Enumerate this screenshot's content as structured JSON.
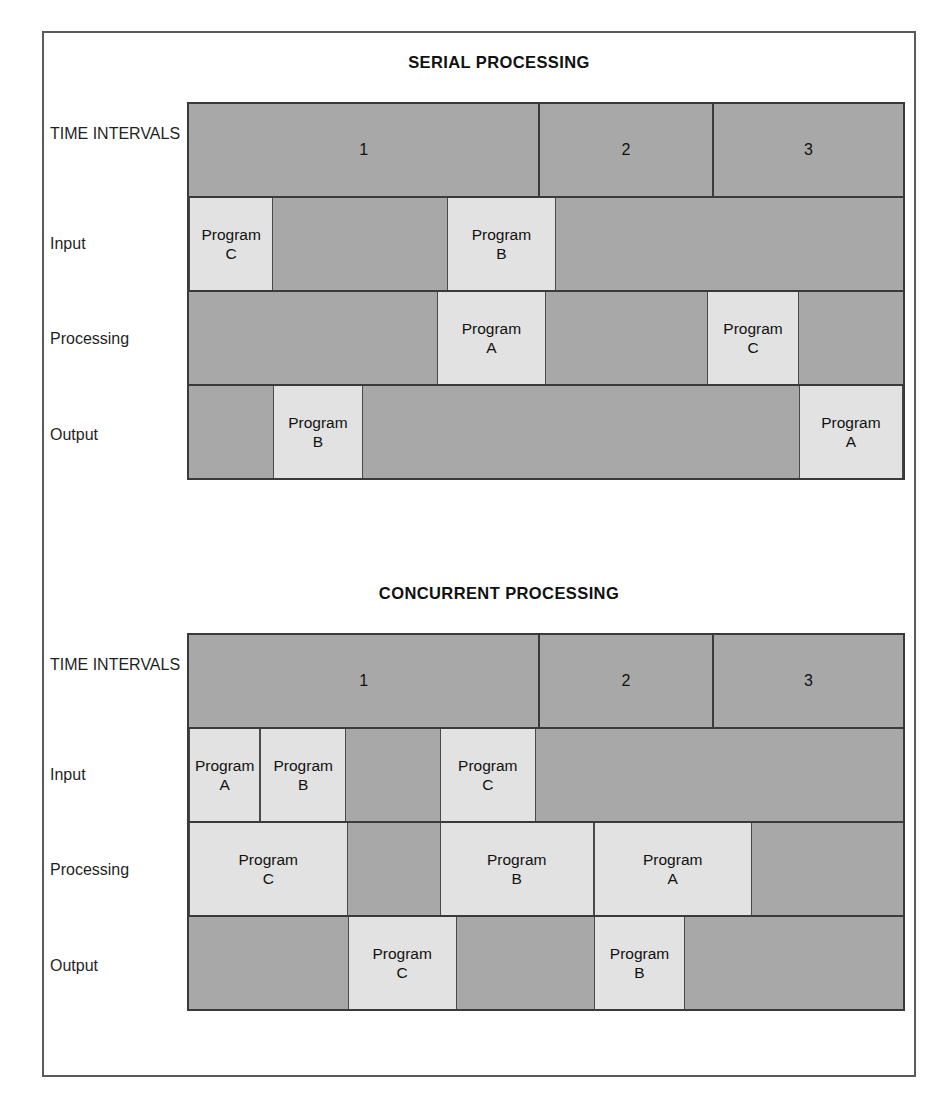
{
  "figure": {
    "background": "#ffffff",
    "border_color": "#5a5a5a",
    "cell_dark_color": "#a8a8a8",
    "cell_light_color": "#e2e2e2",
    "grid_line_color": "#3a3a3a"
  },
  "row_labels": {
    "time_intervals_line1": "TIME",
    "time_intervals_line2": "INTERVALS",
    "input": "Input",
    "processing": "Processing",
    "output": "Output"
  },
  "charts": [
    {
      "id": "serial",
      "title": "SERIAL PROCESSING",
      "intervals": [
        {
          "label": "1",
          "start": 0,
          "end": 49.2
        },
        {
          "label": "2",
          "start": 49.2,
          "end": 73.5
        },
        {
          "label": "3",
          "start": 73.5,
          "end": 100
        }
      ],
      "rows": [
        {
          "name": "Input",
          "blocks": [
            {
              "program_line1": "Program",
              "program_line2": "C",
              "start": 0,
              "end": 11.8
            },
            {
              "program_line1": "Program",
              "program_line2": "B",
              "start": 36.1,
              "end": 51.4
            }
          ]
        },
        {
          "name": "Processing",
          "blocks": [
            {
              "program_line1": "Program",
              "program_line2": "A",
              "start": 34.7,
              "end": 50.0
            },
            {
              "program_line1": "Program",
              "program_line2": "C",
              "start": 72.6,
              "end": 85.4
            }
          ]
        },
        {
          "name": "Output",
          "blocks": [
            {
              "program_line1": "Program",
              "program_line2": "B",
              "start": 11.8,
              "end": 24.3
            },
            {
              "program_line1": "Program",
              "program_line2": "A",
              "start": 85.4,
              "end": 100
            }
          ]
        }
      ]
    },
    {
      "id": "concurrent",
      "title": "CONCURRENT PROCESSING",
      "intervals": [
        {
          "label": "1",
          "start": 0,
          "end": 49.2
        },
        {
          "label": "2",
          "start": 49.2,
          "end": 73.5
        },
        {
          "label": "3",
          "start": 73.5,
          "end": 100
        }
      ],
      "rows": [
        {
          "name": "Input",
          "blocks": [
            {
              "program_line1": "Program",
              "program_line2": "A",
              "start": 0,
              "end": 10.0
            },
            {
              "program_line1": "Program",
              "program_line2": "B",
              "start": 10.0,
              "end": 22.0
            },
            {
              "program_line1": "Program",
              "program_line2": "C",
              "start": 35.1,
              "end": 48.6
            }
          ]
        },
        {
          "name": "Processing",
          "blocks": [
            {
              "program_line1": "Program",
              "program_line2": "C",
              "start": 0,
              "end": 22.2
            },
            {
              "program_line1": "Program",
              "program_line2": "B",
              "start": 35.1,
              "end": 56.7
            },
            {
              "program_line1": "Program",
              "program_line2": "A",
              "start": 56.7,
              "end": 78.8
            }
          ]
        },
        {
          "name": "Output",
          "blocks": [
            {
              "program_line1": "Program",
              "program_line2": "C",
              "start": 22.2,
              "end": 37.5
            },
            {
              "program_line1": "Program",
              "program_line2": "B",
              "start": 56.7,
              "end": 69.5
            }
          ]
        }
      ]
    }
  ]
}
